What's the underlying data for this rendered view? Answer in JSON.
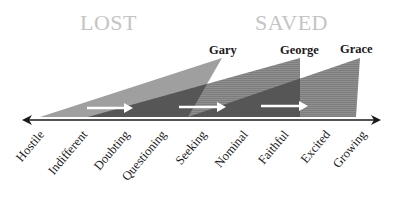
{
  "headings": {
    "left": "LOST",
    "right": "SAVED"
  },
  "people": [
    {
      "name": "Gary",
      "start_stage": "Indifferent",
      "apex_stage": "Seeking"
    },
    {
      "name": "George",
      "start_stage": "Doubting",
      "apex_stage": "Faithful"
    },
    {
      "name": "Grace",
      "start_stage": "Seeking",
      "apex_stage": "Growing"
    }
  ],
  "stages": [
    "Hostile",
    "Indifferent",
    "Doubting",
    "Questioning",
    "Seeking",
    "Nominal",
    "Faithful",
    "Excited",
    "Growing"
  ],
  "colors": {
    "heading": "#c4c4c4",
    "triangle": "#8a8a8a",
    "overlap": "#4a4a4a",
    "arrow": "#ffffff",
    "axis": "#1a1a1a"
  }
}
